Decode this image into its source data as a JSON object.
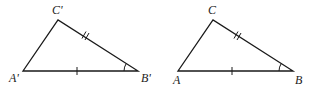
{
  "figures": [
    {
      "name": "triangle-prime",
      "vertices": {
        "A": {
          "label": "A'",
          "x": 23,
          "y": 71
        },
        "B": {
          "label": "B'",
          "x": 138,
          "y": 71
        },
        "C": {
          "label": "C'",
          "x": 58,
          "y": 20
        }
      },
      "marks": {
        "AB": "single tick",
        "BC": "double tick",
        "angle_B": "arc"
      }
    },
    {
      "name": "triangle",
      "vertices": {
        "A": {
          "label": "A",
          "x": 178,
          "y": 71
        },
        "B": {
          "label": "B",
          "x": 293,
          "y": 71
        },
        "C": {
          "label": "C",
          "x": 213,
          "y": 20
        }
      },
      "marks": {
        "AB": "single tick",
        "BC": "double tick",
        "angle_B": "arc"
      }
    }
  ],
  "labels": {
    "t1_a": "A'",
    "t1_b": "B'",
    "t1_c": "C'",
    "t2_a": "A",
    "t2_b": "B",
    "t2_c": "C"
  }
}
